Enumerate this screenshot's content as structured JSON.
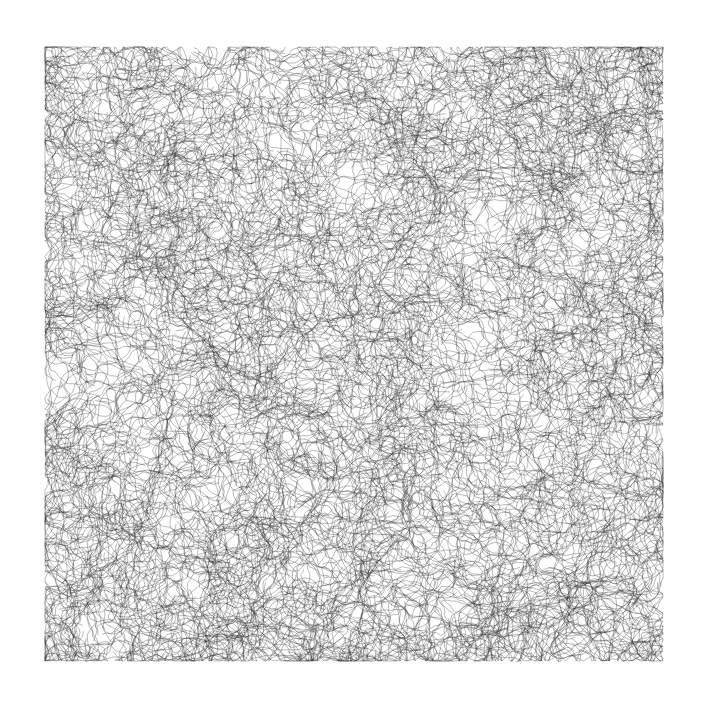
{
  "canvas": {
    "width": 702,
    "height": 703,
    "background": "#ffffff"
  },
  "artwork": {
    "type": "generative-line-tangle",
    "bounds": {
      "x": 44,
      "y": 46,
      "width": 620,
      "height": 616
    },
    "stroke_color": "#1a1a1a",
    "stroke_width": 0.55,
    "stroke_opacity": 0.55,
    "seed": 20240611,
    "paths": 2600,
    "segments_per_path": 14,
    "step_length": 9,
    "turn_amount": 0.9,
    "edge_margin": 1
  }
}
